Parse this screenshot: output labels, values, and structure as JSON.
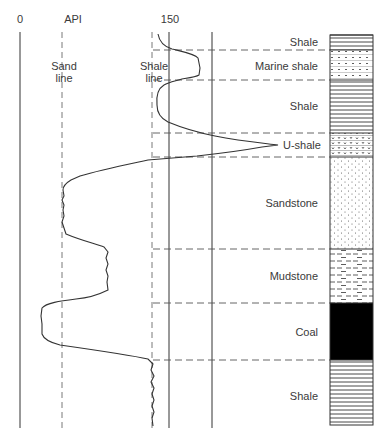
{
  "axis": {
    "min_label": "0",
    "unit_label": "API",
    "max_label": "150",
    "sand_line_label": [
      "Sand",
      "line"
    ],
    "shale_line_label": [
      "Shale",
      "line"
    ]
  },
  "layers": [
    {
      "name": "Shale",
      "pattern": "shale",
      "top": 35,
      "bottom": 50
    },
    {
      "name": "Marine shale",
      "pattern": "marine-shale",
      "top": 50,
      "bottom": 80
    },
    {
      "name": "Shale",
      "pattern": "shale",
      "top": 80,
      "bottom": 133
    },
    {
      "name": "U-shale",
      "pattern": "u-shale",
      "top": 133,
      "bottom": 157
    },
    {
      "name": "Sandstone",
      "pattern": "sandstone",
      "top": 157,
      "bottom": 249
    },
    {
      "name": "Mudstone",
      "pattern": "mudstone",
      "top": 249,
      "bottom": 303
    },
    {
      "name": "Coal",
      "pattern": "coal",
      "top": 303,
      "bottom": 360
    },
    {
      "name": "Shale",
      "pattern": "shale",
      "top": 360,
      "bottom": 425
    }
  ],
  "colors": {
    "line": "#333333",
    "dash": "#555555",
    "coal": "#000000",
    "background": "#ffffff"
  }
}
